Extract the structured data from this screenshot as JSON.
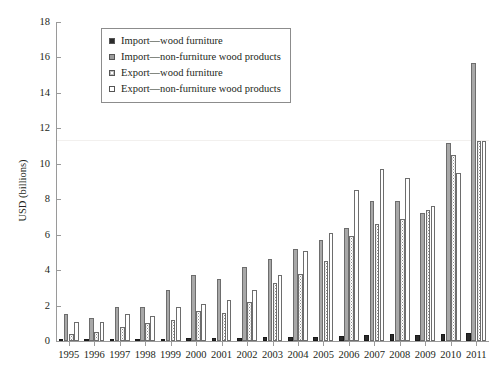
{
  "chart_data": {
    "type": "bar",
    "title": "",
    "xlabel": "",
    "ylabel": "USD (billions)",
    "ylim": [
      0,
      18
    ],
    "yticks": [
      0,
      2,
      4,
      6,
      8,
      10,
      12,
      14,
      16,
      18
    ],
    "ytick_labels": [
      "0",
      "2",
      "4",
      "6",
      "8",
      "10",
      "12",
      "14",
      "16",
      "18"
    ],
    "grid": false,
    "legend_position": "top-left-inside",
    "categories": [
      "1995",
      "1996",
      "1997",
      "1998",
      "1999",
      "2000",
      "2001",
      "2002",
      "2003",
      "2004",
      "2005",
      "2006",
      "2007",
      "2008",
      "2009",
      "2010",
      "2011"
    ],
    "series": [
      {
        "name": "Import—wood furniture",
        "color": "#2b2b2b",
        "values": [
          0.05,
          0.06,
          0.08,
          0.1,
          0.12,
          0.15,
          0.15,
          0.18,
          0.2,
          0.22,
          0.25,
          0.28,
          0.33,
          0.4,
          0.33,
          0.42,
          0.48
        ]
      },
      {
        "name": "Import—non-furniture wood products",
        "color": "#a8a8a8",
        "values": [
          1.5,
          1.3,
          1.9,
          1.9,
          2.9,
          3.7,
          3.5,
          4.2,
          4.6,
          5.2,
          5.7,
          6.4,
          7.9,
          7.9,
          7.2,
          11.2,
          15.7
        ]
      },
      {
        "name": "Export—wood furniture",
        "color": "#ffffff",
        "values": [
          0.4,
          0.5,
          0.8,
          1.0,
          1.2,
          1.7,
          1.6,
          2.2,
          3.3,
          3.8,
          4.5,
          5.9,
          6.6,
          6.9,
          7.4,
          10.5,
          11.3
        ]
      },
      {
        "name": "Export—non-furniture wood products",
        "color": "#ffffff",
        "values": [
          1.1,
          1.1,
          1.5,
          1.4,
          1.9,
          2.1,
          2.3,
          2.9,
          3.7,
          5.1,
          6.1,
          8.5,
          9.7,
          9.2,
          7.6,
          9.5,
          11.3
        ]
      }
    ]
  },
  "legend": {
    "items": [
      "Import—wood furniture",
      "Import—non-furniture wood products",
      "Export—wood furniture",
      "Export—non-furniture wood products"
    ]
  }
}
